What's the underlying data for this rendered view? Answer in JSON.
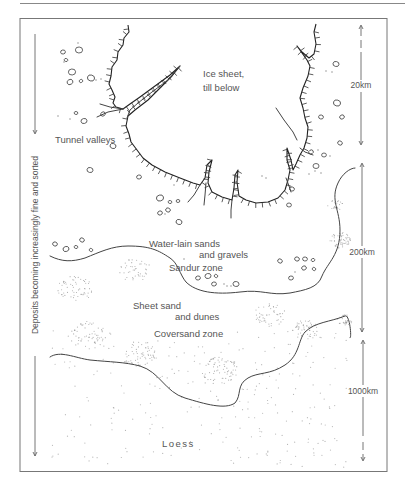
{
  "figure": {
    "labels": {
      "ice_sheet_line1": "Ice sheet,",
      "ice_sheet_line2": "till below",
      "tunnel_valleys": "Tunnel valleys",
      "water_lain_line1": "Water-lain sands",
      "water_lain_line2": "and gravels",
      "sandur_zone": "Sandur zone",
      "sheet_sand_line1": "Sheet sand",
      "sheet_sand_line2": "and dunes",
      "coversand_zone": "Coversand zone",
      "loess": "Loess"
    },
    "left_axis_label": "Deposits becoming increasingly fine and sorted",
    "scale_bars": [
      {
        "label": "20km"
      },
      {
        "label": "200km"
      },
      {
        "label": "1000km"
      }
    ],
    "colors": {
      "ink": "#333333",
      "text": "#555555",
      "stipple": "#999999",
      "frame": "#777777"
    }
  }
}
